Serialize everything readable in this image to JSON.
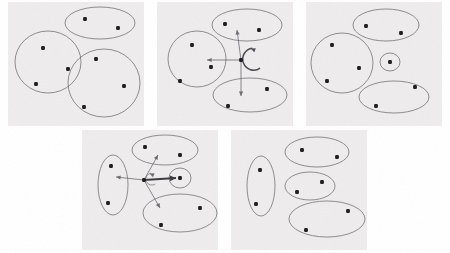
{
  "figure": {
    "panel_count": 5,
    "canvas": {
      "width": 450,
      "height": 253
    },
    "colors": {
      "panel_background": "#eeecec",
      "page_background": "#ffffff",
      "outline": "#6b6b72",
      "node": "#1d1d1f",
      "bold_edge": "#3a3a40",
      "ghost_text": "#dedbd8"
    },
    "legend": {
      "node_label": "data point",
      "blob_label": "cluster boundary",
      "arrow_label": "transition"
    }
  },
  "panels": [
    {
      "id": "panel-1",
      "name": "top-left-panel",
      "caption": "",
      "x": 8,
      "y": 2,
      "width": 136,
      "height": 124,
      "blobs": [
        {
          "name": "cluster-a",
          "shape": "ellipse",
          "cx": 100,
          "cy": 23,
          "rx": 35,
          "ry": 16,
          "rotation": 0
        },
        {
          "name": "cluster-b",
          "shape": "ellipse",
          "cx": 48,
          "cy": 62,
          "rx": 33,
          "ry": 31,
          "rotation": 0
        },
        {
          "name": "cluster-c",
          "shape": "ellipse",
          "cx": 104,
          "cy": 83,
          "rx": 36,
          "ry": 34,
          "rotation": 0
        }
      ],
      "nodes": [
        {
          "name": "node-a1",
          "cx": 85,
          "cy": 19,
          "cluster": "cluster-a"
        },
        {
          "name": "node-a2",
          "cx": 118,
          "cy": 28,
          "cluster": "cluster-a"
        },
        {
          "name": "node-b1",
          "cx": 43,
          "cy": 48,
          "cluster": "cluster-b"
        },
        {
          "name": "node-b2",
          "cx": 68,
          "cy": 69,
          "cluster": "cluster-b"
        },
        {
          "name": "node-b3",
          "cx": 36,
          "cy": 84,
          "cluster": "cluster-b"
        },
        {
          "name": "node-c1",
          "cx": 96,
          "cy": 59,
          "cluster": "cluster-c"
        },
        {
          "name": "node-c2",
          "cx": 124,
          "cy": 86,
          "cluster": "cluster-c"
        },
        {
          "name": "node-c3",
          "cx": 84,
          "cy": 107,
          "cluster": "cluster-c"
        }
      ],
      "edges": []
    },
    {
      "id": "panel-2",
      "name": "top-center-panel",
      "caption": "",
      "x": 157,
      "y": 2,
      "width": 136,
      "height": 124,
      "blobs": [
        {
          "name": "cluster-a",
          "shape": "ellipse",
          "cx": 247,
          "cy": 25,
          "rx": 35,
          "ry": 16,
          "rotation": 0
        },
        {
          "name": "cluster-b",
          "shape": "ellipse",
          "cx": 197,
          "cy": 59,
          "rx": 29,
          "ry": 28,
          "rotation": 0
        },
        {
          "name": "cluster-c",
          "shape": "ellipse",
          "cx": 250,
          "cy": 95,
          "rx": 37,
          "ry": 17,
          "rotation": 0
        }
      ],
      "nodes": [
        {
          "name": "node-a1",
          "cx": 225,
          "cy": 24,
          "cluster": "cluster-a"
        },
        {
          "name": "node-a2",
          "cx": 259,
          "cy": 30,
          "cluster": "cluster-a"
        },
        {
          "name": "node-b1",
          "cx": 192,
          "cy": 45,
          "cluster": "cluster-b"
        },
        {
          "name": "node-b2",
          "cx": 211,
          "cy": 67,
          "cluster": "cluster-b"
        },
        {
          "name": "node-b3",
          "cx": 180,
          "cy": 81,
          "cluster": "cluster-b"
        },
        {
          "name": "node-c1",
          "cx": 267,
          "cy": 89,
          "cluster": "cluster-c"
        },
        {
          "name": "node-c2",
          "cx": 228,
          "cy": 106,
          "cluster": "cluster-c"
        },
        {
          "name": "node-hub",
          "cx": 241,
          "cy": 60,
          "cluster": "hub"
        }
      ],
      "edges": [
        {
          "name": "edge-hub-up",
          "type": "arrow",
          "from": [
            241,
            60
          ],
          "to": [
            237,
            30
          ],
          "style": "plain"
        },
        {
          "name": "edge-hub-left",
          "type": "arrow",
          "from": [
            241,
            60
          ],
          "to": [
            207,
            60
          ],
          "style": "plain"
        },
        {
          "name": "edge-hub-down",
          "type": "arrow",
          "from": [
            241,
            60
          ],
          "to": [
            241,
            96
          ],
          "style": "plain"
        },
        {
          "name": "edge-hub-self-loop",
          "type": "self-loop",
          "anchor": [
            241,
            60
          ],
          "radius": 11,
          "style": "loop"
        }
      ]
    },
    {
      "id": "panel-3",
      "name": "top-right-panel",
      "caption": "",
      "x": 306,
      "y": 2,
      "width": 136,
      "height": 124,
      "blobs": [
        {
          "name": "cluster-a",
          "shape": "ellipse",
          "cx": 386,
          "cy": 25,
          "rx": 33,
          "ry": 16,
          "rotation": 0
        },
        {
          "name": "cluster-b",
          "shape": "ellipse",
          "cx": 342,
          "cy": 63,
          "rx": 31,
          "ry": 30,
          "rotation": 0
        },
        {
          "name": "cluster-small",
          "shape": "ellipse",
          "cx": 390,
          "cy": 62,
          "rx": 10,
          "ry": 9,
          "rotation": 0
        },
        {
          "name": "cluster-c",
          "shape": "ellipse",
          "cx": 394,
          "cy": 97,
          "rx": 35,
          "ry": 16,
          "rotation": 0
        }
      ],
      "nodes": [
        {
          "name": "node-a1",
          "cx": 366,
          "cy": 26,
          "cluster": "cluster-a"
        },
        {
          "name": "node-a2",
          "cx": 401,
          "cy": 33,
          "cluster": "cluster-a"
        },
        {
          "name": "node-b1",
          "cx": 332,
          "cy": 45,
          "cluster": "cluster-b"
        },
        {
          "name": "node-b2",
          "cx": 359,
          "cy": 68,
          "cluster": "cluster-b"
        },
        {
          "name": "node-b3",
          "cx": 327,
          "cy": 81,
          "cluster": "cluster-b"
        },
        {
          "name": "node-small",
          "cx": 390,
          "cy": 62,
          "cluster": "cluster-small"
        },
        {
          "name": "node-c1",
          "cx": 415,
          "cy": 87,
          "cluster": "cluster-c"
        },
        {
          "name": "node-c2",
          "cx": 376,
          "cy": 106,
          "cluster": "cluster-c"
        }
      ],
      "edges": []
    },
    {
      "id": "panel-4",
      "name": "bottom-left-panel",
      "caption": "",
      "x": 82,
      "y": 130,
      "width": 136,
      "height": 120,
      "blobs": [
        {
          "name": "cluster-a",
          "shape": "ellipse",
          "cx": 165,
          "cy": 150,
          "rx": 33,
          "ry": 15,
          "rotation": 0
        },
        {
          "name": "cluster-vertical",
          "shape": "ellipse",
          "cx": 113,
          "cy": 185,
          "rx": 15,
          "ry": 30,
          "rotation": 0
        },
        {
          "name": "cluster-small",
          "shape": "ellipse",
          "cx": 180,
          "cy": 178,
          "rx": 11,
          "ry": 10,
          "rotation": 0
        },
        {
          "name": "cluster-c",
          "shape": "ellipse",
          "cx": 180,
          "cy": 213,
          "rx": 37,
          "ry": 19,
          "rotation": 0
        }
      ],
      "nodes": [
        {
          "name": "node-a1",
          "cx": 145,
          "cy": 147,
          "cluster": "cluster-a"
        },
        {
          "name": "node-a2",
          "cx": 180,
          "cy": 155,
          "cluster": "cluster-a"
        },
        {
          "name": "node-v1",
          "cx": 111,
          "cy": 166,
          "cluster": "cluster-vertical"
        },
        {
          "name": "node-v2",
          "cx": 108,
          "cy": 203,
          "cluster": "cluster-vertical"
        },
        {
          "name": "node-small",
          "cx": 180,
          "cy": 178,
          "cluster": "cluster-small"
        },
        {
          "name": "node-c1",
          "cx": 200,
          "cy": 208,
          "cluster": "cluster-c"
        },
        {
          "name": "node-c2",
          "cx": 161,
          "cy": 225,
          "cluster": "cluster-c"
        },
        {
          "name": "node-hub",
          "cx": 144,
          "cy": 180,
          "cluster": "hub"
        }
      ],
      "edges": [
        {
          "name": "edge-hub-upright",
          "type": "arrow",
          "from": [
            144,
            180
          ],
          "to": [
            158,
            155
          ],
          "style": "plain"
        },
        {
          "name": "edge-hub-right-bold",
          "type": "arrow",
          "from": [
            144,
            180
          ],
          "to": [
            176,
            178
          ],
          "style": "bold"
        },
        {
          "name": "edge-hub-downright",
          "type": "arrow",
          "from": [
            144,
            180
          ],
          "to": [
            160,
            208
          ],
          "style": "plain"
        },
        {
          "name": "edge-hub-left",
          "type": "arrow",
          "from": [
            144,
            180
          ],
          "to": [
            116,
            177
          ],
          "style": "plain"
        },
        {
          "name": "edge-hub-self-loop",
          "type": "self-loop",
          "anchor": [
            144,
            180
          ],
          "radius": 6,
          "style": "loop-small"
        }
      ]
    },
    {
      "id": "panel-5",
      "name": "bottom-right-panel",
      "caption": "",
      "x": 231,
      "y": 130,
      "width": 136,
      "height": 120,
      "blobs": [
        {
          "name": "cluster-a",
          "shape": "ellipse",
          "cx": 317,
          "cy": 152,
          "rx": 32,
          "ry": 15,
          "rotation": 0
        },
        {
          "name": "cluster-vertical",
          "shape": "ellipse",
          "cx": 261,
          "cy": 186,
          "rx": 14,
          "ry": 30,
          "rotation": 0
        },
        {
          "name": "cluster-mid",
          "shape": "ellipse",
          "cx": 310,
          "cy": 186,
          "rx": 25,
          "ry": 14,
          "rotation": 0
        },
        {
          "name": "cluster-c",
          "shape": "ellipse",
          "cx": 327,
          "cy": 219,
          "rx": 38,
          "ry": 18,
          "rotation": 0
        }
      ],
      "nodes": [
        {
          "name": "node-a1",
          "cx": 302,
          "cy": 150,
          "cluster": "cluster-a"
        },
        {
          "name": "node-a2",
          "cx": 337,
          "cy": 157,
          "cluster": "cluster-a"
        },
        {
          "name": "node-v1",
          "cx": 260,
          "cy": 170,
          "cluster": "cluster-vertical"
        },
        {
          "name": "node-v2",
          "cx": 256,
          "cy": 204,
          "cluster": "cluster-vertical"
        },
        {
          "name": "node-m1",
          "cx": 297,
          "cy": 192,
          "cluster": "cluster-mid"
        },
        {
          "name": "node-m2",
          "cx": 322,
          "cy": 182,
          "cluster": "cluster-mid"
        },
        {
          "name": "node-c1",
          "cx": 348,
          "cy": 211,
          "cluster": "cluster-c"
        },
        {
          "name": "node-c2",
          "cx": 306,
          "cy": 230,
          "cluster": "cluster-c"
        }
      ],
      "edges": []
    }
  ],
  "background_ghost_text": [
    {
      "name": "ghost-line-1",
      "text": "the results",
      "x": 92,
      "y": 136
    },
    {
      "name": "ghost-line-2",
      "text": "number of clusters",
      "x": 152,
      "y": 136
    },
    {
      "name": "ghost-line-3",
      "text": "clustering",
      "x": 262,
      "y": 136
    },
    {
      "name": "ghost-line-4",
      "text": "a set of",
      "x": 30,
      "y": 118
    },
    {
      "name": "ghost-line-5",
      "text": "in the",
      "x": 250,
      "y": 122
    }
  ]
}
